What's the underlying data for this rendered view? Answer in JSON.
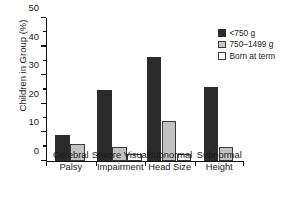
{
  "chart_data": {
    "type": "bar",
    "title": "",
    "xlabel": "",
    "ylabel": "Children in Group (%)",
    "ylim": [
      0,
      50
    ],
    "yticks": [
      0,
      10,
      20,
      30,
      40,
      50
    ],
    "yticks_minor": [
      5,
      15,
      25,
      35,
      45
    ],
    "grid": false,
    "legend_position": "top-right",
    "categories": [
      "Cerebral Palsy",
      "Severe Visual Impairment",
      "Subnormal Head Size",
      "Subnormal Height"
    ],
    "category_lines": [
      [
        "Cerebral",
        "Palsy"
      ],
      [
        "Severe Visual",
        "Impairment"
      ],
      [
        "Subnormal",
        "Head Size"
      ],
      [
        "Subnormal",
        "Height"
      ]
    ],
    "series": [
      {
        "name": "<750 g",
        "color": "#2b2b2b",
        "values": [
          9,
          25,
          36.5,
          26
        ]
      },
      {
        "name": "750–1499 g",
        "color": "#c2c2c2",
        "values": [
          6,
          5,
          14,
          5
        ]
      },
      {
        "name": "Born at term",
        "color": "#ffffff",
        "values": [
          null,
          2.5,
          2.5,
          null
        ]
      }
    ]
  },
  "legend": {
    "items": [
      {
        "label": "<750 g"
      },
      {
        "label": "750–1499 g"
      },
      {
        "label": "Born at term"
      }
    ]
  }
}
